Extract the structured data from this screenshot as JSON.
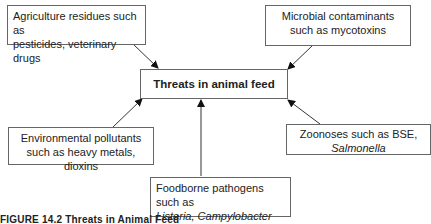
{
  "diagram": {
    "center": "Threats in animal feed",
    "nodes": [
      {
        "id": "agriculture",
        "line1": "Agriculture residues such as",
        "line2": "pesticides, veterinary drugs",
        "line2_italic": false
      },
      {
        "id": "microbial",
        "line1": "Microbial contaminants",
        "line2": "such as mycotoxins",
        "line2_italic": false
      },
      {
        "id": "environmental",
        "line1": "Environmental pollutants",
        "line2": "such as heavy metals, dioxins",
        "line2_italic": false
      },
      {
        "id": "zoonoses",
        "line1": "Zoonoses such as BSE,",
        "line2": "Salmonella",
        "line2_italic": true
      },
      {
        "id": "foodborne",
        "line1": "Foodborne pathogens such as",
        "line2": "Listeria, Campylobacter",
        "line2_italic": true
      }
    ],
    "edges": [
      {
        "from": "agriculture",
        "to": "center"
      },
      {
        "from": "microbial",
        "to": "center"
      },
      {
        "from": "environmental",
        "to": "center"
      },
      {
        "from": "zoonoses",
        "to": "center"
      },
      {
        "from": "foodborne",
        "to": "center"
      }
    ]
  },
  "caption": "FIGURE 14.2  Threats in Animal Feed"
}
